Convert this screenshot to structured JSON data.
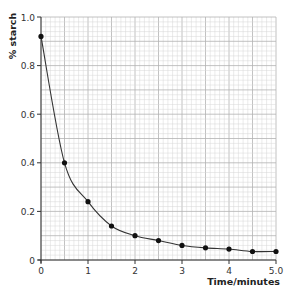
{
  "chart_data": {
    "type": "line",
    "title": "",
    "xlabel": "Time/minutes",
    "ylabel": "% starch",
    "xlim": [
      0,
      5.0
    ],
    "ylim": [
      0,
      1.0
    ],
    "x_ticks": [
      "0",
      "1",
      "2",
      "3",
      "4",
      "5.0"
    ],
    "x_tick_values": [
      0,
      1,
      2,
      3,
      4,
      5
    ],
    "y_ticks": [
      "0",
      "0.2",
      "0.4",
      "0.6",
      "0.8",
      "1.0"
    ],
    "y_tick_values": [
      0,
      0.2,
      0.4,
      0.6,
      0.8,
      1.0
    ],
    "grid": true,
    "grid_minor": {
      "x_step": 0.1,
      "y_step": 0.02
    },
    "legend": null,
    "series": [
      {
        "name": "% starch",
        "marker": "circle",
        "smooth_curve": true,
        "x": [
          0,
          0.5,
          1.0,
          1.5,
          2.0,
          2.5,
          3.0,
          3.5,
          4.0,
          4.5,
          5.0
        ],
        "values": [
          0.92,
          0.4,
          0.24,
          0.14,
          0.1,
          0.08,
          0.06,
          0.05,
          0.045,
          0.035,
          0.035
        ]
      }
    ]
  },
  "colors": {
    "grid_minor": "#d6d6d6",
    "grid_major": "#b3b3b3",
    "axis": "#333333",
    "line": "#333333",
    "marker": "#111111"
  }
}
